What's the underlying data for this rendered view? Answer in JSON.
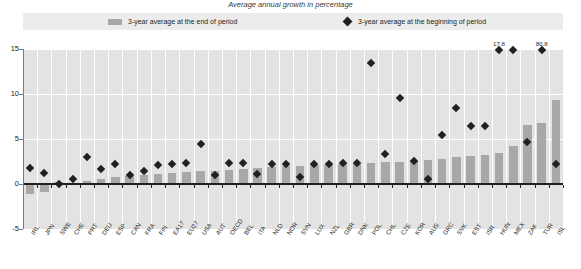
{
  "chart": {
    "title": "Average annual growth in percentage",
    "legend": {
      "bar_label": "3-year average at the end of period",
      "diamond_label": "3-year average at the beginning of period",
      "bar_swatch": "bar-swatch",
      "diamond_swatch": "diamond-swatch"
    }
  },
  "chart_data": {
    "type": "bar",
    "title": "Average annual growth in percentage",
    "xlabel": "",
    "ylabel": "",
    "ylim": [
      -5,
      15
    ],
    "yticks": [
      -5,
      0,
      5,
      10,
      15
    ],
    "grid": "horizontal-and-vertical-white",
    "legend_position": "top",
    "categories": [
      "IRL",
      "JPN",
      "SWE",
      "CHE",
      "PRT",
      "DEU",
      "ESP",
      "CAN",
      "FRA",
      "FIN",
      "EA17",
      "EU27",
      "USA",
      "AUT",
      "OECD",
      "BEL",
      "ITA",
      "NLD",
      "NOR",
      "SVN",
      "LUX",
      "NZL",
      "GBR",
      "DNK",
      "POL",
      "CHL",
      "CZE",
      "KOR",
      "AUS",
      "GRC",
      "SVK",
      "EST",
      "ISR",
      "HUN",
      "MEX",
      "ZAF",
      "TUR",
      "ISL"
    ],
    "series": [
      {
        "name": "3-year average at the end of period",
        "type": "bar",
        "color": "#a8a8a8",
        "values": [
          -1.1,
          -0.9,
          0.2,
          0.1,
          0.3,
          0.6,
          0.8,
          0.9,
          1.0,
          1.1,
          1.2,
          1.3,
          1.4,
          1.5,
          1.6,
          1.7,
          1.8,
          1.9,
          2.0,
          2.0,
          2.1,
          2.1,
          2.2,
          2.2,
          2.3,
          2.4,
          2.5,
          2.6,
          2.7,
          2.8,
          3.0,
          3.1,
          3.2,
          3.4,
          4.2,
          6.6,
          6.8,
          9.3
        ]
      },
      {
        "name": "3-year average at the beginning of period",
        "type": "scatter",
        "marker": "diamond",
        "color": "#231f20",
        "values": [
          1.8,
          1.2,
          0.0,
          0.6,
          3.0,
          1.7,
          2.2,
          1.0,
          1.4,
          2.1,
          2.2,
          2.3,
          4.5,
          1.0,
          2.3,
          2.3,
          1.1,
          2.2,
          2.2,
          0.8,
          2.2,
          2.2,
          2.3,
          2.3,
          13.4,
          3.3,
          9.6,
          2.6,
          0.6,
          5.4,
          8.5,
          6.5,
          6.4,
          17.8,
          17.8,
          4.7,
          80.8,
          2.2
        ]
      }
    ],
    "annotations": [
      {
        "label": "17.8",
        "category": "HUN",
        "value": 17.8,
        "clipped": true
      },
      {
        "label": "80.8",
        "category": "TUR",
        "value": 80.8,
        "clipped": true
      }
    ]
  }
}
